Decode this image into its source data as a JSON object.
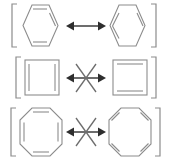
{
  "figure": {
    "background_color": "#ffffff",
    "structure_stroke_color": "#8c8c8c",
    "arrow_color": "#2e2e2e",
    "cross_color": "#6d6d6d",
    "width": 169,
    "height": 161
  },
  "rows": [
    {
      "id": "row-1",
      "name": "benzene-resonance",
      "arrow": {
        "type": "double-headed-resonance-arrow",
        "crossed": false,
        "label": "resonance-arrow"
      },
      "left": {
        "name": "benzene-kekule-structure-a",
        "shape": "hexagon",
        "sides": 6,
        "double_bond_sides": [
          0,
          2,
          4
        ],
        "brackets": "left-only"
      },
      "right": {
        "name": "benzene-kekule-structure-b",
        "shape": "hexagon",
        "sides": 6,
        "double_bond_sides": [
          1,
          3,
          5
        ],
        "brackets": "right-only"
      }
    },
    {
      "id": "row-2",
      "name": "cyclobutadiene-no-resonance",
      "arrow": {
        "type": "double-headed-resonance-arrow",
        "crossed": true,
        "label": "crossed-resonance-arrow"
      },
      "left": {
        "name": "cyclobutadiene-structure-a",
        "shape": "square",
        "sides": 4,
        "double_bond_sides": [
          1,
          3
        ],
        "brackets": "left-only"
      },
      "right": {
        "name": "cyclobutadiene-structure-b",
        "shape": "square",
        "sides": 4,
        "double_bond_sides": [
          0,
          2
        ],
        "brackets": "right-only"
      }
    },
    {
      "id": "row-3",
      "name": "cyclooctatetraene-no-resonance",
      "arrow": {
        "type": "double-headed-resonance-arrow",
        "crossed": true,
        "label": "crossed-resonance-arrow"
      },
      "left": {
        "name": "cyclooctatetraene-structure-a",
        "shape": "octagon",
        "sides": 8,
        "double_bond_sides": [
          0,
          2,
          4,
          6
        ],
        "brackets": "left-only"
      },
      "right": {
        "name": "cyclooctatetraene-structure-b",
        "shape": "octagon",
        "sides": 8,
        "double_bond_sides": [
          1,
          3,
          5,
          7
        ],
        "brackets": "right-only"
      }
    }
  ]
}
